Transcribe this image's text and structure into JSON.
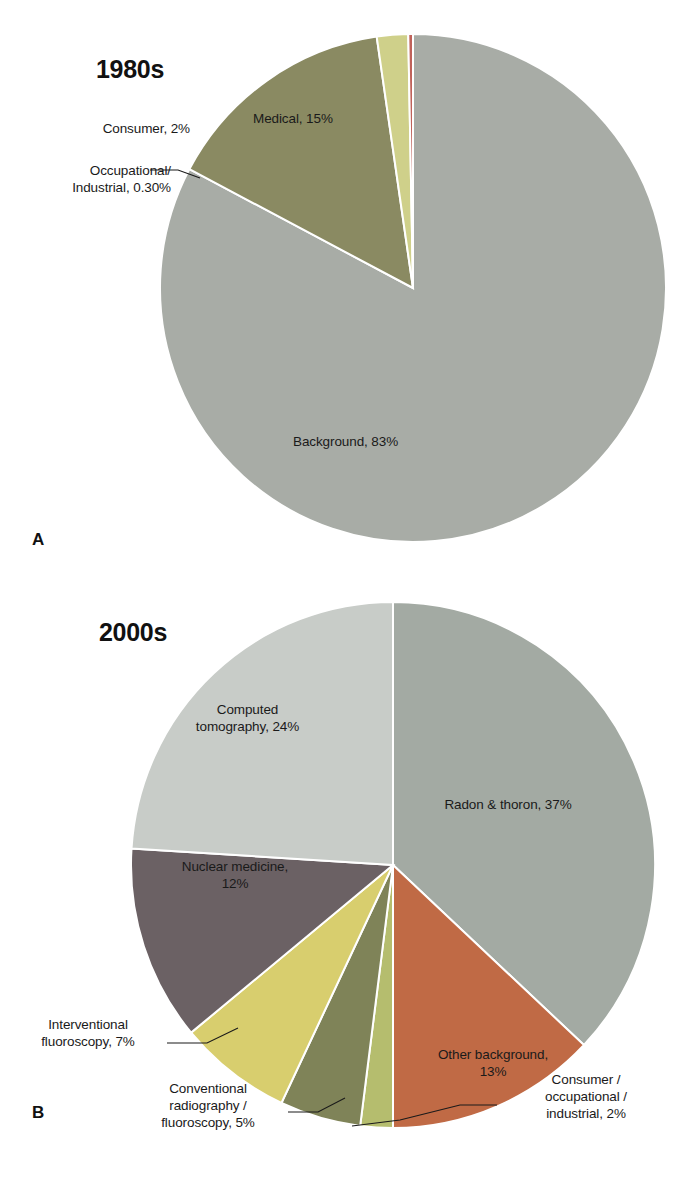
{
  "figure": {
    "background_color": "#ffffff",
    "panels": [
      {
        "letter": "A",
        "title": "1980s"
      },
      {
        "letter": "B",
        "title": "2000s"
      }
    ]
  },
  "chart_data": [
    {
      "type": "pie",
      "title": "1980s",
      "panel_letter": "A",
      "start_angle_deg": 0,
      "direction": "clockwise",
      "categories": [
        "Background",
        "Medical",
        "Consumer",
        "Occupational/Industrial"
      ],
      "values": [
        83,
        15,
        2,
        0.3
      ],
      "labels": [
        "Background, 83%",
        "Medical, 15%",
        "Consumer, 2%",
        "Occupational/\nIndustrial, 0.30%"
      ],
      "colors": [
        "#a8aca6",
        "#8a8a62",
        "#cfd08a",
        "#c0625a"
      ],
      "legend": "none",
      "grid": false
    },
    {
      "type": "pie",
      "title": "2000s",
      "panel_letter": "B",
      "start_angle_deg": 0,
      "direction": "clockwise",
      "categories": [
        "Radon & thoron",
        "Other background",
        "Consumer / occupational / industrial",
        "Conventional radiography / fluoroscopy",
        "Interventional fluoroscopy",
        "Nuclear medicine",
        "Computed tomography"
      ],
      "values": [
        37,
        13,
        2,
        5,
        7,
        12,
        24
      ],
      "labels": [
        "Radon & thoron, 37%",
        "Other background,\n13%",
        "Consumer /\noccupational /\nindustrial, 2%",
        "Conventional\nradiography /\nfluoroscopy, 5%",
        "Interventional\nfluoroscopy, 7%",
        "Nuclear medicine,\n12%",
        "Computed\ntomography, 24%"
      ],
      "colors": [
        "#a3aaa3",
        "#c06a45",
        "#b5bd6e",
        "#7f8358",
        "#d8ce6e",
        "#6b6164",
        "#c8ccc8"
      ],
      "legend": "none",
      "grid": false
    }
  ],
  "panel_a": {
    "title": "1980s",
    "letter": "A",
    "slices": [
      {
        "id": "background",
        "label": "Background, 83%",
        "value": 83,
        "color": "#a8aca6"
      },
      {
        "id": "medical",
        "label": "Medical, 15%",
        "value": 15,
        "color": "#8a8a62"
      },
      {
        "id": "consumer",
        "label": "Consumer, 2%",
        "value": 2,
        "color": "#cfd08a"
      },
      {
        "id": "occupational",
        "label": "Occupational/\nIndustrial, 0.30%",
        "value": 0.3,
        "color": "#c0625a"
      }
    ]
  },
  "panel_b": {
    "title": "2000s",
    "letter": "B",
    "slices": [
      {
        "id": "radon-thoron",
        "label": "Radon & thoron, 37%",
        "value": 37,
        "color": "#a3aaa3"
      },
      {
        "id": "other-background",
        "label": "Other background,\n13%",
        "value": 13,
        "color": "#c06a45"
      },
      {
        "id": "consumer-occ-industrial",
        "label": "Consumer /\noccupational /\nindustrial, 2%",
        "value": 2,
        "color": "#b5bd6e"
      },
      {
        "id": "conventional-radiography",
        "label": "Conventional\nradiography /\nfluoroscopy, 5%",
        "value": 5,
        "color": "#7f8358"
      },
      {
        "id": "interventional-fluoroscopy",
        "label": "Interventional\nfluoroscopy, 7%",
        "value": 7,
        "color": "#d8ce6e"
      },
      {
        "id": "nuclear-medicine",
        "label": "Nuclear medicine,\n12%",
        "value": 12,
        "color": "#6b6164"
      },
      {
        "id": "computed-tomography",
        "label": "Computed\ntomography, 24%",
        "value": 24,
        "color": "#c8ccc8"
      }
    ]
  }
}
